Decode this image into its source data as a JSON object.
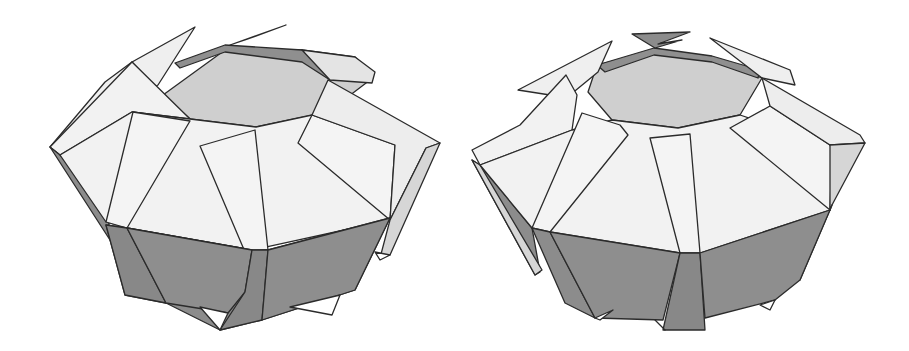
{
  "figure": {
    "colors": {
      "light_face": "#efefef",
      "mid_face": "#d6d6d6",
      "inner_face": "#c9c9c9",
      "dark_face": "#8c8c8c",
      "edge": "#2b2b2b",
      "background": "#ffffff"
    },
    "models": [
      {
        "id": "left",
        "label": "",
        "side_count": 8
      },
      {
        "id": "right",
        "label": "",
        "side_count": 10
      }
    ]
  }
}
